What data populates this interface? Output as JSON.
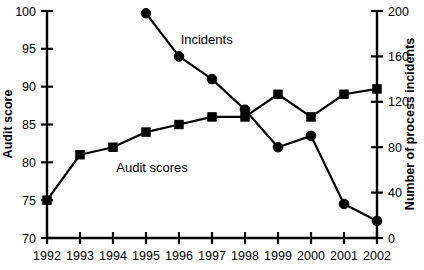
{
  "chart_data": {
    "type": "line",
    "title": "",
    "xlabel": "",
    "grid": false,
    "legend_position": "inline-annotations",
    "categories": [
      "1992",
      "1993",
      "1994",
      "1995",
      "1996",
      "1997",
      "1998",
      "1999",
      "2000",
      "2001",
      "2002"
    ],
    "axes": {
      "x": {
        "tick_labels": [
          "1992",
          "1993",
          "1994",
          "1995",
          "1996",
          "1997",
          "1998",
          "1999",
          "2000",
          "2001",
          "2002"
        ],
        "range": [
          1992,
          2002
        ]
      },
      "y_left": {
        "label": "Audit score",
        "ticks": [
          70,
          75,
          80,
          85,
          90,
          95,
          100
        ],
        "tick_labels": [
          "70",
          "75",
          "80",
          "85",
          "90",
          "95",
          "100"
        ],
        "range": [
          70,
          100
        ]
      },
      "y_right": {
        "label": "Number of process incidents",
        "ticks": [
          0,
          40,
          80,
          120,
          160,
          200
        ],
        "tick_labels": [
          "0",
          "40",
          "80",
          "120",
          "160",
          "200"
        ],
        "range": [
          0,
          200
        ]
      }
    },
    "series": [
      {
        "name": "Audit scores",
        "axis": "y_left",
        "marker": "square",
        "annotation": "Audit scores",
        "x": [
          "1992",
          "1993",
          "1994",
          "1995",
          "1996",
          "1997",
          "1998",
          "1999",
          "2000",
          "2001",
          "2002"
        ],
        "values": [
          75,
          81,
          82,
          84,
          85,
          86,
          86,
          89,
          86,
          89,
          89.7
        ]
      },
      {
        "name": "Incidents",
        "axis": "y_right",
        "marker": "circle",
        "annotation": "Incidents",
        "x": [
          "1995",
          "1996",
          "1997",
          "1998",
          "1999",
          "2000",
          "2001",
          "2002"
        ],
        "values": [
          198,
          160,
          140,
          113,
          80,
          90,
          30,
          15
        ]
      }
    ],
    "annotations": [
      {
        "text": "Incidents",
        "x": 1996.05,
        "y_left_equiv": 96.2
      },
      {
        "text": "Audit scores",
        "x": 1994.1,
        "y_left_equiv": 79.2
      }
    ]
  }
}
